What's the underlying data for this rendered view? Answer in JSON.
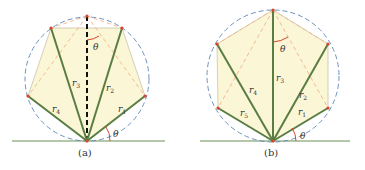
{
  "colors": {
    "fill": "#fbf6d6",
    "edge": "#c9c4a8",
    "radius": "#5a7d44",
    "dashed_circle": "#5b86b8",
    "dashed_chord": "#f0b48a",
    "vertex": "#d9452b",
    "angle": "#d9452b",
    "ground": "#6b8f52"
  },
  "panel_a": {
    "caption": "(a)",
    "theta_top": "θ",
    "theta_bottom": "θ",
    "radii": [
      {
        "label": "r",
        "sub": "1"
      },
      {
        "label": "r",
        "sub": "2"
      },
      {
        "label": "r",
        "sub": "3"
      },
      {
        "label": "r",
        "sub": "4"
      }
    ]
  },
  "panel_b": {
    "caption": "(b)",
    "theta_top": "θ",
    "theta_bottom": "θ",
    "radii": [
      {
        "label": "r",
        "sub": "1"
      },
      {
        "label": "r",
        "sub": "2"
      },
      {
        "label": "r",
        "sub": "3"
      },
      {
        "label": "r",
        "sub": "4"
      },
      {
        "label": "r",
        "sub": "5"
      }
    ]
  }
}
